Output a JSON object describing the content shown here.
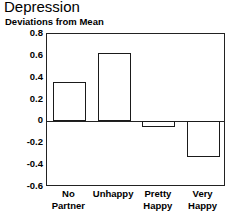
{
  "chart_data": {
    "type": "bar",
    "title": "Depression",
    "subtitle": "Deviations from Mean",
    "xlabel": "",
    "ylabel": "",
    "categories": [
      "No Partner",
      "Unhappy",
      "Pretty Happy",
      "Very Happy"
    ],
    "category_lines": [
      [
        "No",
        "Partner"
      ],
      [
        "Unhappy"
      ],
      [
        "Pretty",
        "Happy"
      ],
      [
        "Very",
        "Happy"
      ]
    ],
    "values": [
      0.36,
      0.63,
      -0.05,
      -0.33
    ],
    "ylim": [
      -0.6,
      0.8
    ],
    "yticks": [
      0.8,
      0.6,
      0.4,
      0.2,
      0,
      -0.2,
      -0.4,
      -0.6
    ],
    "ytick_labels": [
      "0.8",
      "0.6",
      "0.4",
      "0.2",
      "0",
      "-0.2",
      "-0.4",
      "-0.6"
    ],
    "grid": false,
    "legend": null,
    "bar_fill": "#ffffff",
    "bar_stroke": "#1a1a1a",
    "axis_color": "#222222",
    "zero_reference": 0
  }
}
